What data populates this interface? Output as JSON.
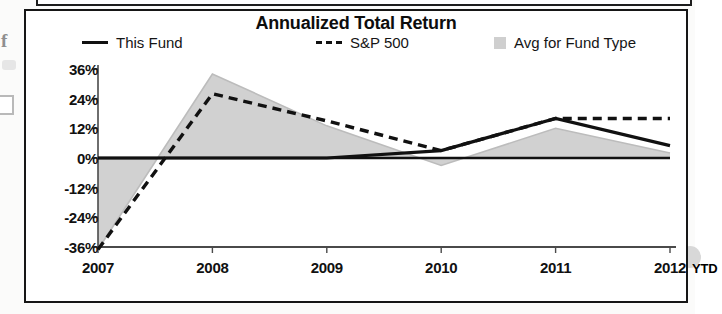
{
  "document": {
    "artifact_letter": "f"
  },
  "chart": {
    "title": "Annualized Total Return",
    "x_suffix_label": "YTD",
    "legend": [
      {
        "label": "This Fund",
        "marker": "solid-line-swatch",
        "color": "#111111"
      },
      {
        "label": "S&P 500",
        "marker": "dashed-line-swatch",
        "color": "#111111"
      },
      {
        "label": "Avg for Fund Type",
        "marker": "area-square-swatch",
        "color": "#cfcfcf"
      }
    ]
  },
  "chart_data": {
    "type": "line",
    "title": "Annualized Total Return",
    "xlabel": "",
    "ylabel": "",
    "categories": [
      "2007",
      "2008",
      "2009",
      "2010",
      "2011",
      "2012"
    ],
    "x_axis_note": "2012 YTD",
    "ylim": [
      -36,
      36
    ],
    "yticks": [
      36,
      24,
      12,
      0,
      -12,
      -24,
      -36
    ],
    "ytick_labels": [
      "36%",
      "24%",
      "12%",
      "0%",
      "-12%",
      "-24%",
      "-36%"
    ],
    "grid": false,
    "legend_position": "top",
    "series": [
      {
        "name": "This Fund",
        "style": "solid",
        "color": "#111111",
        "values": [
          0,
          0,
          0,
          3,
          16,
          5
        ]
      },
      {
        "name": "S&P 500",
        "style": "dashed",
        "color": "#111111",
        "values": [
          -37,
          26,
          15,
          3,
          16,
          16
        ]
      },
      {
        "name": "Avg for Fund Type",
        "style": "area",
        "color": "#cfcfcf",
        "values": [
          -37,
          34,
          13,
          -3,
          12,
          2
        ]
      }
    ]
  }
}
